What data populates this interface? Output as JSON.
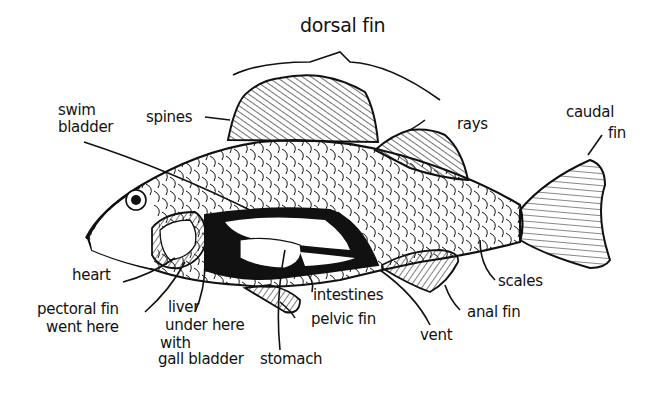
{
  "labels": {
    "dorsal_fin": "dorsal fin",
    "swim": "swim",
    "bladder": "bladder",
    "spines": "spines",
    "rays": "rays",
    "caudal": "caudal",
    "fin": "fin",
    "heart": "heart",
    "pectoral1": "pectoral fin",
    "pectoral2": "went here",
    "liver1": "liver",
    "liver2": "under here",
    "liver3": "with",
    "liver4": "gall bladder",
    "stomach": "stomach",
    "intestines": "intestines",
    "pelvic_fin": "pelvic fin",
    "vent": "vent",
    "anal_fin": "anal fin",
    "scales": "scales"
  },
  "colors": {
    "ink": "#111111",
    "paper": "#ffffff"
  }
}
